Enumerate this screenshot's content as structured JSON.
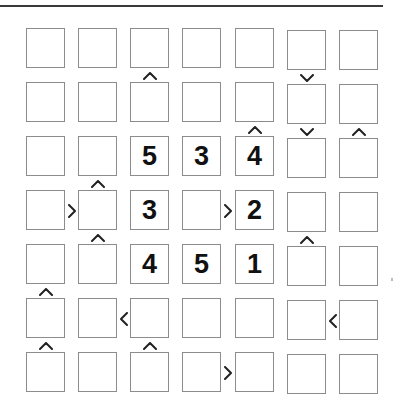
{
  "puzzle": {
    "type": "futoshiki",
    "size": 7,
    "grid": [
      [
        "",
        "",
        "",
        "",
        "",
        "",
        ""
      ],
      [
        "",
        "",
        "",
        "",
        "",
        "",
        ""
      ],
      [
        "",
        "",
        "5",
        "3",
        "4",
        "",
        ""
      ],
      [
        "",
        "",
        "3",
        "",
        "2",
        "",
        ""
      ],
      [
        "",
        "",
        "4",
        "5",
        "1",
        "",
        ""
      ],
      [
        "",
        "",
        "",
        "",
        "",
        "",
        ""
      ],
      [
        "",
        "",
        "",
        "",
        "",
        "",
        ""
      ]
    ],
    "vertical_constraints": [
      {
        "between_rows": [
          1,
          2
        ],
        "col": 3,
        "symbol": "^"
      },
      {
        "between_rows": [
          1,
          2
        ],
        "col": 6,
        "symbol": "v"
      },
      {
        "between_rows": [
          2,
          3
        ],
        "col": 5,
        "symbol": "^"
      },
      {
        "between_rows": [
          2,
          3
        ],
        "col": 6,
        "symbol": "v"
      },
      {
        "between_rows": [
          2,
          3
        ],
        "col": 7,
        "symbol": "^"
      },
      {
        "between_rows": [
          3,
          4
        ],
        "col": 2,
        "symbol": "^"
      },
      {
        "between_rows": [
          4,
          5
        ],
        "col": 2,
        "symbol": "^"
      },
      {
        "between_rows": [
          4,
          5
        ],
        "col": 6,
        "symbol": "^"
      },
      {
        "between_rows": [
          5,
          6
        ],
        "col": 1,
        "symbol": "^"
      },
      {
        "between_rows": [
          6,
          7
        ],
        "col": 1,
        "symbol": "^"
      },
      {
        "between_rows": [
          6,
          7
        ],
        "col": 3,
        "symbol": "^"
      }
    ],
    "horizontal_constraints": [
      {
        "row": 4,
        "between_cols": [
          1,
          2
        ],
        "symbol": ">"
      },
      {
        "row": 4,
        "between_cols": [
          4,
          5
        ],
        "symbol": ">"
      },
      {
        "row": 6,
        "between_cols": [
          2,
          3
        ],
        "symbol": "<"
      },
      {
        "row": 6,
        "between_cols": [
          6,
          7
        ],
        "symbol": "<"
      },
      {
        "row": 7,
        "between_cols": [
          4,
          5
        ],
        "symbol": ">"
      }
    ]
  }
}
